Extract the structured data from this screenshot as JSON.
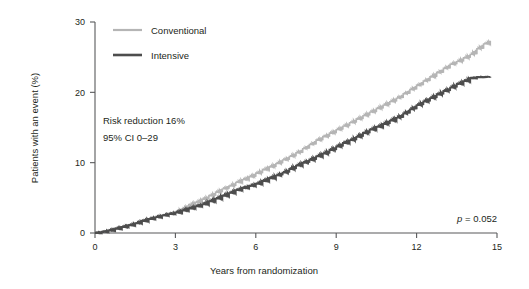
{
  "chart_data": {
    "type": "line",
    "title": "",
    "subtitle": "",
    "xlabel": "Years from randomization",
    "ylabel": "Patients with an event (%)",
    "xlim": [
      0,
      15
    ],
    "ylim": [
      0,
      30
    ],
    "xticks": [
      "0",
      "3",
      "6",
      "9",
      "12",
      "15"
    ],
    "xtick_values": [
      0,
      3,
      6,
      9,
      12,
      15
    ],
    "yticks": [
      "0",
      "10",
      "20",
      "30"
    ],
    "ytick_values": [
      0,
      10,
      20,
      30
    ],
    "grid": false,
    "legend_position": "top-left",
    "x": [
      0,
      0.25,
      0.5,
      0.75,
      1,
      1.25,
      1.5,
      1.75,
      2,
      2.25,
      2.5,
      2.75,
      3,
      3.25,
      3.5,
      3.75,
      4,
      4.25,
      4.5,
      4.75,
      5,
      5.25,
      5.5,
      5.75,
      6,
      6.25,
      6.5,
      6.75,
      7,
      7.25,
      7.5,
      7.75,
      8,
      8.25,
      8.5,
      8.75,
      9,
      9.25,
      9.5,
      9.75,
      10,
      10.25,
      10.5,
      10.75,
      11,
      11.25,
      11.5,
      11.75,
      12,
      12.25,
      12.5,
      12.75,
      13,
      13.25,
      13.5,
      13.75,
      14,
      14.25,
      14.5,
      14.75
    ],
    "series": [
      {
        "name": "Conventional",
        "color": "#b5b5b5",
        "final_value": 27.3,
        "values": [
          0,
          0.15,
          0.35,
          0.6,
          0.85,
          1.1,
          1.4,
          1.7,
          2.0,
          2.25,
          2.5,
          2.75,
          3.0,
          3.5,
          4.0,
          4.4,
          4.8,
          5.3,
          5.8,
          6.3,
          6.7,
          7.2,
          7.6,
          8.0,
          8.5,
          9.0,
          9.4,
          9.9,
          10.4,
          10.9,
          11.4,
          12.0,
          12.6,
          13.2,
          13.7,
          14.2,
          14.7,
          15.2,
          15.7,
          16.2,
          16.7,
          17.2,
          17.7,
          18.2,
          18.7,
          19.2,
          19.8,
          20.4,
          21.0,
          21.6,
          22.2,
          22.8,
          23.4,
          24.0,
          24.4,
          24.9,
          25.4,
          26.2,
          26.9,
          27.3
        ]
      },
      {
        "name": "Intensive",
        "color": "#4d4d4d",
        "final_value": 22.2,
        "values": [
          0,
          0.15,
          0.35,
          0.6,
          0.85,
          1.1,
          1.4,
          1.7,
          2.0,
          2.25,
          2.5,
          2.7,
          2.9,
          3.2,
          3.5,
          3.8,
          4.1,
          4.5,
          4.9,
          5.3,
          5.7,
          6.1,
          6.4,
          6.7,
          7.0,
          7.4,
          7.8,
          8.2,
          8.6,
          9.1,
          9.6,
          10.0,
          10.4,
          10.9,
          11.3,
          11.8,
          12.3,
          12.8,
          13.2,
          13.7,
          14.2,
          14.7,
          15.1,
          15.5,
          16.0,
          16.4,
          17.0,
          17.6,
          18.2,
          18.7,
          19.2,
          19.7,
          20.2,
          20.7,
          21.2,
          21.6,
          22.0,
          22.15,
          22.2,
          22.2
        ]
      }
    ],
    "annotations": [
      {
        "id": "risk-reduction",
        "text": "Risk reduction 16%"
      },
      {
        "id": "confidence-interval",
        "text": "95% CI 0–29"
      },
      {
        "id": "p-value",
        "text_italic": "p",
        "text": " = 0.052"
      }
    ]
  },
  "legend": {
    "items": [
      {
        "label": "Conventional",
        "color": "#b5b5b5"
      },
      {
        "label": "Intensive",
        "color": "#4d4d4d"
      }
    ]
  },
  "colors": {
    "conventional": "#b5b5b5",
    "intensive": "#4d4d4d",
    "axis": "#58595b",
    "text": "#231f20",
    "background": "#ffffff"
  }
}
